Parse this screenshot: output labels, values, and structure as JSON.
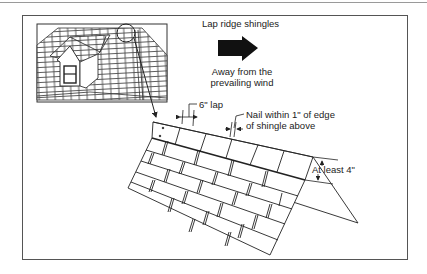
{
  "figure": {
    "title_label": "Lap ridge shingles",
    "direction_caption_line1": "Away from the",
    "direction_caption_line2": "prevailing wind",
    "lap_label": "6\" lap",
    "nail_label_line1": "Nail within 1\" of edge",
    "nail_label_line2": "of shingle above",
    "exposure_label": "At least 4\"",
    "icons": {
      "wind-arrow": "right-arrow-solid",
      "detail-circle": "magnifier-circle"
    },
    "colors": {
      "ink": "#222222",
      "frame": "#555555",
      "background": "#ffffff"
    }
  }
}
